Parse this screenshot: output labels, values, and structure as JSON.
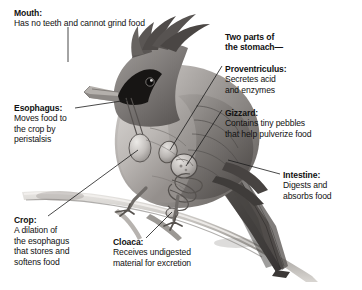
{
  "diagram": {
    "background_color": "#ffffff",
    "text_color": "#111111",
    "leader_line_color": "#1a1a1a"
  },
  "labels": [
    {
      "id": "mouth",
      "heading": "Mouth:",
      "lines": [
        "Has no teeth and cannot grind food"
      ]
    },
    {
      "id": "esophagus",
      "heading": "Esophagus:",
      "lines": [
        "Moves food to",
        "the crop by",
        "peristalsis"
      ]
    },
    {
      "id": "crop",
      "heading": "Crop:",
      "lines": [
        "A dilation of",
        "the esophagus",
        "that stores and",
        "softens food"
      ]
    },
    {
      "id": "cloaca",
      "heading": "Cloaca:",
      "lines": [
        "Receives undigested",
        "material for excretion"
      ]
    },
    {
      "id": "stomach",
      "heading": "Two parts of",
      "lines": [
        "the stomach—"
      ]
    },
    {
      "id": "proventriculus",
      "heading": "Proventriculus:",
      "lines": [
        "Secretes acid",
        "and enzymes"
      ]
    },
    {
      "id": "gizzard",
      "heading": "Gizzard:",
      "lines": [
        "Contains tiny pebbles",
        "that help pulverize food"
      ]
    },
    {
      "id": "intestine",
      "heading": "Intestine:",
      "lines": [
        "Digests and",
        "absorbs food"
      ]
    }
  ]
}
